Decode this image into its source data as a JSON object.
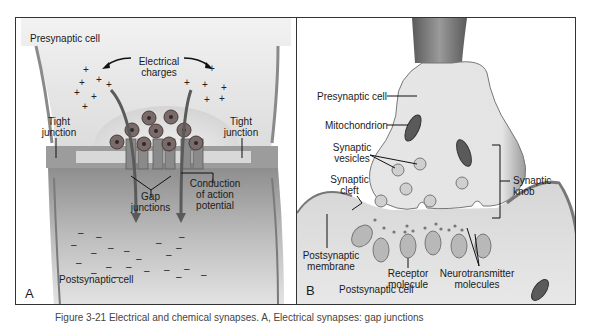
{
  "figure": {
    "caption_partial": "Figure 3-21  Electrical and chemical synapses. A, Electrical synapses: gap junctions"
  },
  "panel_a": {
    "letter": "A",
    "title": "Electrical synapse",
    "labels": {
      "presynaptic_cell": "Presynaptic cell",
      "electrical_charges_1": "Electrical",
      "electrical_charges_2": "charges",
      "tight_junction_left_1": "Tight",
      "tight_junction_left_2": "junction",
      "tight_junction_right_1": "Tight",
      "tight_junction_right_2": "junction",
      "gap_junctions_1": "Gap",
      "gap_junctions_2": "junctions",
      "conduction_1": "Conduction",
      "conduction_2": "of action",
      "conduction_3": "potential",
      "postsynaptic_cell": "Postsynaptic cell"
    },
    "positive_charge_symbol": "+",
    "negative_charge_symbol": "–"
  },
  "panel_b": {
    "letter": "B",
    "title": "Chemical synapse",
    "labels": {
      "presynaptic_cell": "Presynaptic cell",
      "mitochondrion": "Mitochondrion",
      "synaptic_vesicles_1": "Synaptic",
      "synaptic_vesicles_2": "vesicles",
      "synaptic_cleft_1": "Synaptic",
      "synaptic_cleft_2": "cleft",
      "synaptic_knob_1": "Synaptic",
      "synaptic_knob_2": "knob",
      "postsynaptic_membrane_1": "Postsynaptic",
      "postsynaptic_membrane_2": "membrane",
      "receptor_molecule_1": "Receptor",
      "receptor_molecule_2": "molecule",
      "neurotransmitter_1": "Neurotransmitter",
      "neurotransmitter_2": "molecules",
      "postsynaptic_cell": "Postsynaptic cell"
    }
  },
  "colors": {
    "border": "#333333",
    "cell_fill_light": "#e6e6e6",
    "cell_fill_mid": "#c8c8c8",
    "membrane_dark": "#6a6a6a",
    "vesicle_fill": "#9a9a9a",
    "vesicle_core": "#3a3a3a",
    "arrow": "#555555"
  }
}
